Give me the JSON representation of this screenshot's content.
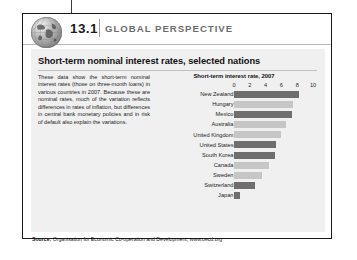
{
  "header": {
    "chapter_number": "13.1",
    "title": "GLOBAL PERSPECTIVE",
    "globe_icon": "globe-icon"
  },
  "panel": {
    "title": "Short-term nominal interest rates, selected nations",
    "blurb": "These data show the short-term nominal interest rates (those on three-month loans) in various countries in 2007. Because these are nominal rates, much of the variation reflects differences in rates of inflation, but differences in central bank monetary policies and in risk of default also explain the variations.",
    "source_label": "Source:",
    "source_text": " Organisation for Economic Co-operation and Development, www.oecd.org"
  },
  "colors": {
    "bar_dark": "#6e6e6e",
    "bar_light": "#c6c6c6",
    "panel_bg": "#f0f0f0",
    "header_title": "#6d6d6d",
    "border": "#1a1a1a"
  },
  "chart_data": {
    "type": "bar",
    "orientation": "horizontal",
    "title": "Short-term interest rate, 2007",
    "xlabel": "",
    "ylabel": "",
    "xlim": [
      0,
      10
    ],
    "ticks": [
      0,
      2,
      4,
      6,
      8,
      10
    ],
    "grid": false,
    "legend": "none",
    "categories": [
      "New Zealand",
      "Hungary",
      "Mexico",
      "Australia",
      "United Kingdom",
      "United States",
      "South Korea",
      "Canada",
      "Sweden",
      "Switzerland",
      "Japan"
    ],
    "values": [
      8.2,
      7.5,
      7.4,
      6.6,
      6.0,
      5.3,
      5.2,
      4.4,
      3.6,
      2.7,
      0.7
    ],
    "bar_shades": [
      "dark",
      "light",
      "dark",
      "light",
      "light",
      "dark",
      "dark",
      "light",
      "light",
      "dark",
      "dark"
    ]
  }
}
